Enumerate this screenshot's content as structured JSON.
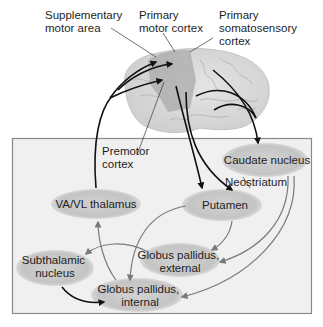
{
  "diagram": {
    "cortex_labels": {
      "supplementary_motor_area": [
        "Supplementary",
        "motor area"
      ],
      "primary_motor_cortex": [
        "Primary",
        "motor cortex"
      ],
      "primary_somatosensory_cortex": [
        "Primary",
        "somatosensory",
        "cortex"
      ],
      "premotor_cortex": [
        "Premotor",
        "cortex"
      ]
    },
    "nodes": {
      "caudate_nucleus": [
        "Caudate nucleus"
      ],
      "neostriatum": [
        "Neostriatum"
      ],
      "putamen": [
        "Putamen"
      ],
      "va_vl_thalamus": [
        "VA/VL thalamus"
      ],
      "globus_pallidus_external": [
        "Globus pallidus,",
        "external"
      ],
      "subthalamic_nucleus": [
        "Subthalamic",
        "nucleus"
      ],
      "globus_pallidus_internal": [
        "Globus pallidus,",
        "internal"
      ]
    },
    "connections": [
      {
        "from": "cortex",
        "to": "caudate_nucleus",
        "style": "black"
      },
      {
        "from": "cortex",
        "to": "putamen",
        "style": "black"
      },
      {
        "from": "va_vl_thalamus",
        "to": "cortex",
        "style": "black"
      },
      {
        "from": "caudate_nucleus",
        "to": "globus_pallidus_external",
        "style": "gray"
      },
      {
        "from": "caudate_nucleus",
        "to": "globus_pallidus_internal",
        "style": "gray"
      },
      {
        "from": "putamen",
        "to": "globus_pallidus_external",
        "style": "gray"
      },
      {
        "from": "putamen",
        "to": "globus_pallidus_internal",
        "style": "gray"
      },
      {
        "from": "globus_pallidus_external",
        "to": "subthalamic_nucleus",
        "style": "gray"
      },
      {
        "from": "subthalamic_nucleus",
        "to": "globus_pallidus_internal",
        "style": "black"
      },
      {
        "from": "globus_pallidus_internal",
        "to": "va_vl_thalamus",
        "style": "gray"
      }
    ],
    "colors": {
      "box_fill": "#f0f0f0",
      "box_border": "#8a8a8a",
      "node_fill": "#c8c8c8",
      "brain_fill": "#dcdcdc",
      "brain_motor_region": "#a8a8a8",
      "black_arrow": "#111111",
      "gray_arrow": "#7a7a7a"
    }
  }
}
